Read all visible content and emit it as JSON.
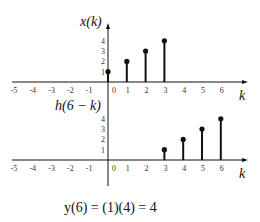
{
  "top_plot": {
    "ylabel": "x(k)",
    "xlabel": "k",
    "x_ticks": [
      "-5",
      "-4",
      "-3",
      "-2",
      "-1",
      "0",
      "1",
      "2",
      "3",
      "4",
      "5",
      "6"
    ],
    "y_ticks": [
      "1",
      "2",
      "3",
      "4"
    ],
    "stems": [
      {
        "k": 0,
        "v": 1
      },
      {
        "k": 1,
        "v": 2
      },
      {
        "k": 2,
        "v": 3
      },
      {
        "k": 3,
        "v": 4
      }
    ]
  },
  "bottom_plot": {
    "ylabel": "h(6 − k)",
    "xlabel": "k",
    "x_ticks": [
      "-5",
      "-4",
      "-3",
      "-2",
      "-1",
      "0",
      "1",
      "2",
      "3",
      "4",
      "5",
      "6"
    ],
    "y_ticks": [
      "1",
      "2",
      "3",
      "4"
    ],
    "stems": [
      {
        "k": 3,
        "v": 1
      },
      {
        "k": 4,
        "v": 2
      },
      {
        "k": 5,
        "v": 3
      },
      {
        "k": 6,
        "v": 4
      }
    ]
  },
  "equation": "y(6) = (1)(4) = 4"
}
